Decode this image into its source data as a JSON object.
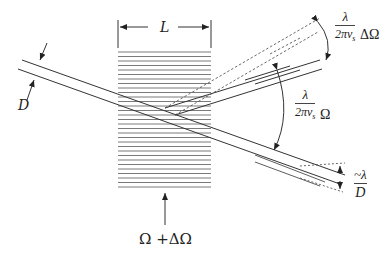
{
  "figure": {
    "type": "acousto-optic diffraction diagram",
    "labels": {
      "grating_length": "L",
      "beam_diameter": "D",
      "acoustic_frequency": "Ω +ΔΩ",
      "scan_angle": {
        "numerator": "λ",
        "denominator_main": "2πv",
        "denominator_sub": "s",
        "suffix": "ΔΩ"
      },
      "deflection_angle": {
        "numerator": "λ",
        "denominator_main": "2πv",
        "denominator_sub": "s",
        "suffix": "Ω"
      },
      "divergence": {
        "numerator": "~λ",
        "denominator": "D"
      }
    },
    "colors": {
      "ink": "#333333",
      "grating": "#777777",
      "background": "#ffffff"
    }
  }
}
